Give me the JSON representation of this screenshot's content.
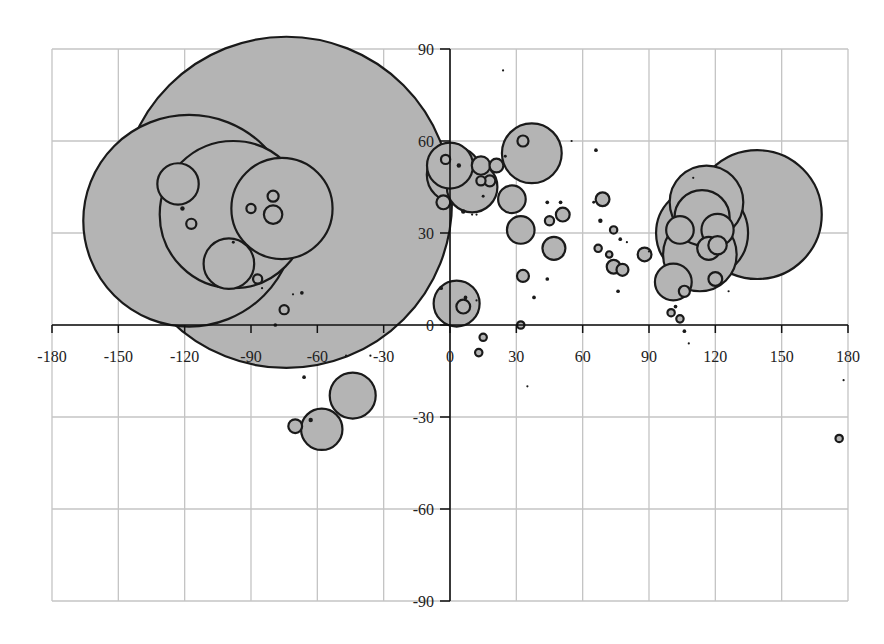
{
  "chart_data": {
    "type": "scatter",
    "subtype": "bubble",
    "title": "",
    "xlabel": "",
    "ylabel": "",
    "xlim": [
      -180,
      180
    ],
    "ylim": [
      -90,
      90
    ],
    "grid": true,
    "legend": null,
    "x_ticks": [
      -180,
      -150,
      -120,
      -90,
      -60,
      -30,
      0,
      30,
      60,
      90,
      120,
      150,
      180
    ],
    "x_tick_labels": [
      "-180",
      "-150",
      "-120",
      "-90",
      "-60",
      "-30",
      "0",
      "30",
      "60",
      "90",
      "120",
      "150",
      "180"
    ],
    "y_ticks": [
      90,
      60,
      30,
      0,
      -30,
      -60,
      -90
    ],
    "y_tick_labels": [
      "90",
      "60",
      "30",
      "0",
      "-30",
      "-60",
      "-90"
    ],
    "bubble_fill": "#b4b4b4",
    "bubble_stroke": "#1a1a1a",
    "points": [
      {
        "x": -74,
        "y": 40,
        "r": 36
      },
      {
        "x": -98,
        "y": 36,
        "r": 16
      },
      {
        "x": -118,
        "y": 34,
        "r": 23
      },
      {
        "x": -76,
        "y": 38,
        "r": 11
      },
      {
        "x": -123,
        "y": 46,
        "r": 4.5
      },
      {
        "x": -100,
        "y": 20,
        "r": 5.5
      },
      {
        "x": -80,
        "y": 36,
        "r": 2
      },
      {
        "x": -80,
        "y": 42,
        "r": 1.2
      },
      {
        "x": -121,
        "y": 38,
        "r": 0.6
      },
      {
        "x": -117,
        "y": 33,
        "r": 1.1
      },
      {
        "x": -90,
        "y": 38,
        "r": 1
      },
      {
        "x": -98,
        "y": 27,
        "r": 0.4
      },
      {
        "x": -87,
        "y": 15,
        "r": 1.0
      },
      {
        "x": -85,
        "y": 12,
        "r": 0.3
      },
      {
        "x": -71,
        "y": 10,
        "r": 0.3
      },
      {
        "x": -67,
        "y": 10.5,
        "r": 0.5
      },
      {
        "x": -75,
        "y": 5,
        "r": 1.0
      },
      {
        "x": -79,
        "y": 0,
        "r": 0.5
      },
      {
        "x": -66,
        "y": -17,
        "r": 0.5
      },
      {
        "x": -47,
        "y": -10,
        "r": 0.2
      },
      {
        "x": -36,
        "y": -10,
        "r": 0.2
      },
      {
        "x": -44,
        "y": -23,
        "r": 5
      },
      {
        "x": -58,
        "y": -34,
        "r": 4.5
      },
      {
        "x": -70,
        "y": -33,
        "r": 1.5
      },
      {
        "x": -63,
        "y": -31,
        "r": 0.6
      },
      {
        "x": 0,
        "y": 52,
        "r": 5
      },
      {
        "x": 2,
        "y": 49,
        "r": 6
      },
      {
        "x": 10,
        "y": 45,
        "r": 5.5
      },
      {
        "x": -2,
        "y": 54,
        "r": 1
      },
      {
        "x": 4,
        "y": 52,
        "r": 0.6
      },
      {
        "x": 14,
        "y": 52,
        "r": 2
      },
      {
        "x": 21,
        "y": 52,
        "r": 1.5
      },
      {
        "x": 18,
        "y": 47,
        "r": 1.2
      },
      {
        "x": 14,
        "y": 47,
        "r": 1
      },
      {
        "x": 25,
        "y": 55,
        "r": 0.4
      },
      {
        "x": 24,
        "y": 83,
        "r": 0.2
      },
      {
        "x": -3,
        "y": 40,
        "r": 1.5
      },
      {
        "x": 6,
        "y": 37,
        "r": 0.6
      },
      {
        "x": 10,
        "y": 36,
        "r": 0.2
      },
      {
        "x": 12,
        "y": 36,
        "r": 0.2
      },
      {
        "x": 15,
        "y": 42,
        "r": 0.4
      },
      {
        "x": 28,
        "y": 41,
        "r": 3
      },
      {
        "x": 32,
        "y": 31,
        "r": 3
      },
      {
        "x": 33,
        "y": 60,
        "r": 1.2
      },
      {
        "x": 37,
        "y": 56,
        "r": 6.5
      },
      {
        "x": 44,
        "y": 40,
        "r": 0.5
      },
      {
        "x": 50,
        "y": 40,
        "r": 0.5
      },
      {
        "x": 45,
        "y": 34,
        "r": 1
      },
      {
        "x": 51,
        "y": 36,
        "r": 1.5
      },
      {
        "x": 47,
        "y": 25,
        "r": 2.5
      },
      {
        "x": 55,
        "y": 60,
        "r": 0.2
      },
      {
        "x": 66,
        "y": 57,
        "r": 0.5
      },
      {
        "x": 65,
        "y": 40,
        "r": 0.4
      },
      {
        "x": 69,
        "y": 41,
        "r": 1.5
      },
      {
        "x": 68,
        "y": 34,
        "r": 0.6
      },
      {
        "x": 67,
        "y": 25,
        "r": 0.8
      },
      {
        "x": 74,
        "y": 31,
        "r": 0.8
      },
      {
        "x": 74,
        "y": 19,
        "r": 1.5
      },
      {
        "x": 78,
        "y": 18,
        "r": 1.3
      },
      {
        "x": 77,
        "y": 28,
        "r": 0.5
      },
      {
        "x": 72,
        "y": 23,
        "r": 0.7
      },
      {
        "x": 76,
        "y": 11,
        "r": 0.5
      },
      {
        "x": 80,
        "y": 27,
        "r": 0.2
      },
      {
        "x": 88,
        "y": 23,
        "r": 1.5
      },
      {
        "x": 90,
        "y": 24,
        "r": 0.3
      },
      {
        "x": 33,
        "y": 16,
        "r": 1.3
      },
      {
        "x": 38,
        "y": 9,
        "r": 0.5
      },
      {
        "x": 44,
        "y": 15,
        "r": 0.5
      },
      {
        "x": -4,
        "y": 12,
        "r": 0.5
      },
      {
        "x": 7,
        "y": 9,
        "r": 0.5
      },
      {
        "x": 12,
        "y": 8,
        "r": 0.2
      },
      {
        "x": 3,
        "y": 7,
        "r": 5
      },
      {
        "x": 6,
        "y": 6,
        "r": 1.5
      },
      {
        "x": 32,
        "y": 0,
        "r": 0.8
      },
      {
        "x": 35,
        "y": -20,
        "r": 0.2
      },
      {
        "x": 15,
        "y": -4,
        "r": 0.8
      },
      {
        "x": 13,
        "y": -9,
        "r": 0.8
      },
      {
        "x": 116,
        "y": 40,
        "r": 8
      },
      {
        "x": 114,
        "y": 35,
        "r": 6
      },
      {
        "x": 114,
        "y": 30,
        "r": 10
      },
      {
        "x": 113,
        "y": 23,
        "r": 8
      },
      {
        "x": 104,
        "y": 31,
        "r": 3
      },
      {
        "x": 121,
        "y": 31,
        "r": 3.5
      },
      {
        "x": 117,
        "y": 25,
        "r": 2.5
      },
      {
        "x": 121,
        "y": 26,
        "r": 2
      },
      {
        "x": 139,
        "y": 36,
        "r": 14
      },
      {
        "x": 101,
        "y": 14,
        "r": 4
      },
      {
        "x": 106,
        "y": 11,
        "r": 1.2
      },
      {
        "x": 120,
        "y": 15,
        "r": 1.5
      },
      {
        "x": 126,
        "y": 11,
        "r": 0.3
      },
      {
        "x": 110,
        "y": 48,
        "r": 0.3
      },
      {
        "x": 100,
        "y": 4,
        "r": 0.8
      },
      {
        "x": 104,
        "y": 2,
        "r": 0.8
      },
      {
        "x": 106,
        "y": -2,
        "r": 0.5
      },
      {
        "x": 108,
        "y": -6,
        "r": 0.2
      },
      {
        "x": 102,
        "y": 6,
        "r": 0.5
      },
      {
        "x": 176,
        "y": -37,
        "r": 0.8
      },
      {
        "x": 178,
        "y": -18,
        "r": 0.2
      }
    ]
  }
}
